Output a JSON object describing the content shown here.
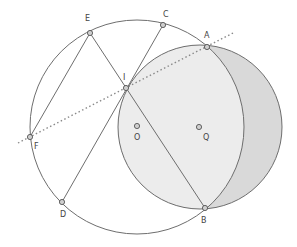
{
  "diagram": {
    "colors": {
      "stroke": "#6e6e6e",
      "lune_fill": "#d9d9d9",
      "overlap_fill": "#ececec",
      "point_fill": "#cfcfcf",
      "dotted_line": "#8a8a8a"
    },
    "circles": [
      {
        "name": "O",
        "cx": 137,
        "cy": 127,
        "r": 107
      },
      {
        "name": "Q",
        "cx": 200,
        "cy": 127,
        "r": 82
      }
    ],
    "points": [
      {
        "name": "A",
        "x": 207,
        "y": 47,
        "label": "A",
        "lx": 204,
        "ly": 38
      },
      {
        "name": "B",
        "x": 205,
        "y": 208,
        "label": "B",
        "lx": 201,
        "ly": 223
      },
      {
        "name": "C",
        "x": 163,
        "y": 25,
        "label": "C",
        "lx": 163,
        "ly": 17
      },
      {
        "name": "D",
        "x": 62,
        "y": 202,
        "label": "D",
        "lx": 60,
        "ly": 217
      },
      {
        "name": "E",
        "x": 90,
        "y": 33,
        "label": "E",
        "lx": 85,
        "ly": 21
      },
      {
        "name": "F",
        "x": 30,
        "y": 137,
        "label": "F",
        "lx": 34,
        "ly": 149
      },
      {
        "name": "I",
        "x": 126,
        "y": 88,
        "label": "I",
        "lx": 123,
        "ly": 80
      },
      {
        "name": "O",
        "x": 137,
        "y": 126,
        "label": "O",
        "lx": 134,
        "ly": 140
      },
      {
        "name": "Q",
        "x": 199,
        "y": 127,
        "label": "Q",
        "lx": 203,
        "ly": 140
      }
    ],
    "segments": [
      {
        "from": "E",
        "to": "F"
      },
      {
        "from": "E",
        "to": "B"
      },
      {
        "from": "C",
        "to": "D"
      }
    ],
    "dotted_line": {
      "x1": 18,
      "y1": 143,
      "x2": 235,
      "y2": 32
    }
  }
}
